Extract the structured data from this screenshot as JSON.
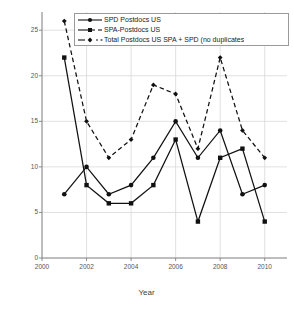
{
  "chart_data": {
    "type": "line",
    "title": "",
    "xlabel": "Year",
    "ylabel": "",
    "x": [
      2001,
      2002,
      2003,
      2004,
      2005,
      2006,
      2007,
      2008,
      2009,
      2010
    ],
    "xlim": [
      2000,
      2011
    ],
    "ylim": [
      0,
      27
    ],
    "xticks": [
      2000,
      2002,
      2004,
      2006,
      2008,
      2010
    ],
    "xtick_labels": [
      "2000",
      "2002",
      "2004",
      "2006",
      "2008",
      "2010"
    ],
    "yticks": [
      0,
      5,
      10,
      15,
      20,
      25
    ],
    "ytick_labels": [
      "0",
      "5",
      "10",
      "15",
      "20",
      "25"
    ],
    "grid": true,
    "legend_position": "top-right",
    "series": [
      {
        "name": "SPD Postdocs US",
        "marker": "circle",
        "linestyle": "solid",
        "color": "#111111",
        "values": [
          7,
          10,
          7,
          8,
          11,
          15,
          11,
          14,
          7,
          8
        ]
      },
      {
        "name": "SPA-Postdocs US",
        "marker": "square",
        "linestyle": "solid",
        "color": "#111111",
        "values": [
          22,
          8,
          6,
          6,
          8,
          13,
          4,
          11,
          12,
          4
        ]
      },
      {
        "name": "Total Postdocs US SPA + SPD (no duplicates",
        "marker": "diamond",
        "linestyle": "dashed",
        "color": "#111111",
        "values": [
          26,
          15,
          11,
          13,
          19,
          18,
          12,
          22,
          14,
          11
        ]
      }
    ]
  },
  "axis": {
    "x_title": "Year"
  },
  "legend": {
    "entries": [
      {
        "label": "SPD Postdocs US"
      },
      {
        "label": "SPA-Postdocs US"
      },
      {
        "label": "Total Postdocs US SPA + SPD (no duplicates"
      }
    ]
  }
}
